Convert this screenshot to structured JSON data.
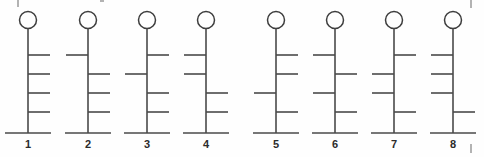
{
  "diagram": {
    "canvas": {
      "width": 484,
      "height": 157
    },
    "background_color": "#fefefe",
    "line_color": "#4a4a4a",
    "circle_stroke_color": "#3d3d3d",
    "label_color": "#2b2b2b",
    "geometry": {
      "circle_center_y": 20,
      "circle_radius": 8.5,
      "stem_top_y": 28.5,
      "base_y": 133,
      "base_half_width": 23,
      "branch_length": 22,
      "branch_y_positions": [
        55,
        74,
        93,
        112
      ]
    },
    "figures": [
      {
        "label": "1",
        "stem_x": 28,
        "branches": [
          "right",
          "right",
          "right",
          "right"
        ]
      },
      {
        "label": "2",
        "stem_x": 88,
        "branches": [
          "left",
          "right",
          "right",
          "right"
        ]
      },
      {
        "label": "3",
        "stem_x": 147,
        "branches": [
          "right",
          "left",
          "right",
          "right"
        ]
      },
      {
        "label": "4",
        "stem_x": 206,
        "branches": [
          "left",
          "left",
          "right",
          "right"
        ]
      },
      {
        "label": "5",
        "stem_x": 276,
        "branches": [
          "right",
          "right",
          "left",
          "right"
        ]
      },
      {
        "label": "6",
        "stem_x": 335,
        "branches": [
          "left",
          "right",
          "left",
          "right"
        ]
      },
      {
        "label": "7",
        "stem_x": 394,
        "branches": [
          "right",
          "left",
          "left",
          "right"
        ]
      },
      {
        "label": "8",
        "stem_x": 453,
        "branches": [
          "left",
          "left",
          "left",
          "right"
        ]
      }
    ],
    "edge_artifacts": [
      {
        "name": "top-left-tick",
        "x1": 18,
        "y1": 0,
        "x2": 18,
        "y2": 7
      },
      {
        "name": "top-mid-tick",
        "x1": 100,
        "y1": 1,
        "x2": 104,
        "y2": 1
      },
      {
        "name": "top-right-tick",
        "x1": 471,
        "y1": 0,
        "x2": 471,
        "y2": 8
      },
      {
        "name": "bottom-right-tick",
        "x1": 471,
        "y1": 144,
        "x2": 471,
        "y2": 153
      }
    ]
  }
}
